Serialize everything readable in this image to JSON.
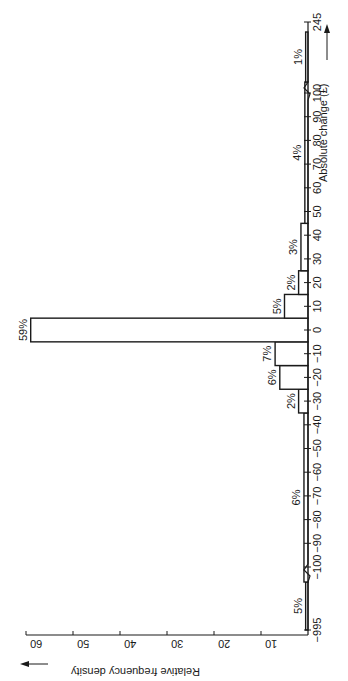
{
  "chart_data": {
    "type": "bar",
    "orientation": "rotated-90-histogram",
    "title": "",
    "xlabel": "Absolute change (£)",
    "ylabel": "Relative frequency density",
    "x_ticks": [
      -995,
      -100,
      -90,
      -80,
      -70,
      -60,
      -50,
      -40,
      -30,
      -20,
      -10,
      0,
      10,
      20,
      30,
      40,
      50,
      60,
      70,
      80,
      90,
      100,
      245
    ],
    "x_tick_labels": [
      "−995",
      "−100",
      "−90",
      "−80",
      "−70",
      "−60",
      "−50",
      "−40",
      "−30",
      "−20",
      "−10",
      "0",
      "10",
      "20",
      "30",
      "40",
      "50",
      "60",
      "70",
      "80",
      "90",
      "100",
      "245"
    ],
    "y_ticks": [
      10,
      20,
      30,
      40,
      50,
      60
    ],
    "ylim": [
      0,
      60
    ],
    "grid": false,
    "axis_breaks": [
      {
        "between": [
          -995,
          -105
        ]
      },
      {
        "between": [
          105,
          245
        ]
      }
    ],
    "bins": [
      {
        "from": -995,
        "to": -105,
        "percent": 5,
        "label": "5%",
        "density": 0.5
      },
      {
        "from": -105,
        "to": -35,
        "percent": 6,
        "label": "6%",
        "density": 0.86
      },
      {
        "from": -35,
        "to": -25,
        "percent": 2,
        "label": "2%",
        "density": 2
      },
      {
        "from": -25,
        "to": -15,
        "percent": 6,
        "label": "6%",
        "density": 6
      },
      {
        "from": -15,
        "to": -5,
        "percent": 7,
        "label": "7%",
        "density": 7
      },
      {
        "from": -5,
        "to": 5,
        "percent": 59,
        "label": "59%",
        "density": 59
      },
      {
        "from": 5,
        "to": 15,
        "percent": 5,
        "label": "5%",
        "density": 5
      },
      {
        "from": 15,
        "to": 25,
        "percent": 2,
        "label": "2%",
        "density": 2
      },
      {
        "from": 25,
        "to": 45,
        "percent": 3,
        "label": "3%",
        "density": 1.5
      },
      {
        "from": 45,
        "to": 105,
        "percent": 4,
        "label": "4%",
        "density": 0.67
      },
      {
        "from": 105,
        "to": 245,
        "percent": 1,
        "label": "1%",
        "density": 0.5
      }
    ]
  },
  "labels": {
    "x_axis_title": "Absolute change (£)",
    "y_axis_title": "Relative frequency density"
  }
}
